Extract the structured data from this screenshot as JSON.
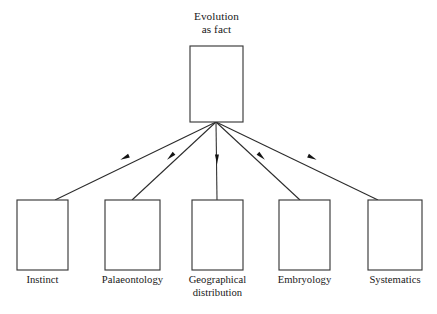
{
  "diagram": {
    "type": "hierarchy-tree",
    "orientation": "top-down",
    "background_color": "#ffffff",
    "box_stroke_color": "#3a3a3a",
    "line_color": "#2b2b2b",
    "text_color": "#171717",
    "root": {
      "id": "evolution-as-fact",
      "label_line_1": "Evolution",
      "label_line_2": "as fact",
      "label_full": "Evolution as fact",
      "label_position": "above-box",
      "box": {
        "x": 190,
        "y": 46,
        "width": 53,
        "height": 76
      }
    },
    "branch_origin": {
      "x": 216,
      "y": 122
    },
    "children": [
      {
        "id": "instinct",
        "label_line_1": "Instinct",
        "label_line_2": "",
        "label_full": "Instinct",
        "label_position": "below-box",
        "box": {
          "x": 17,
          "y": 200,
          "width": 51,
          "height": 70
        },
        "connector": {
          "from": {
            "x": 216,
            "y": 122
          },
          "to": {
            "x": 55,
            "y": 200
          },
          "arrowhead": {
            "x": 124,
            "y": 158
          }
        }
      },
      {
        "id": "palaeontology",
        "label_line_1": "Palaeontology",
        "label_line_2": "",
        "label_full": "Palaeontology",
        "label_position": "below-box",
        "box": {
          "x": 105,
          "y": 200,
          "width": 55,
          "height": 70
        },
        "connector": {
          "from": {
            "x": 216,
            "y": 122
          },
          "to": {
            "x": 132,
            "y": 200
          },
          "arrowhead": {
            "x": 170,
            "y": 157
          }
        }
      },
      {
        "id": "geographical-distribution",
        "label_line_1": "Geographical",
        "label_line_2": "distribution",
        "label_full": "Geographical distribution",
        "label_position": "below-box",
        "box": {
          "x": 192,
          "y": 200,
          "width": 51,
          "height": 70
        },
        "connector": {
          "from": {
            "x": 216,
            "y": 122
          },
          "to": {
            "x": 217,
            "y": 200
          },
          "arrowhead": {
            "x": 217,
            "y": 160
          }
        }
      },
      {
        "id": "embryology",
        "label_line_1": "Embryology",
        "label_line_2": "",
        "label_full": "Embryology",
        "label_position": "below-box",
        "box": {
          "x": 279,
          "y": 200,
          "width": 51,
          "height": 70
        },
        "connector": {
          "from": {
            "x": 216,
            "y": 122
          },
          "to": {
            "x": 300,
            "y": 200
          },
          "arrowhead": {
            "x": 262,
            "y": 157
          }
        }
      },
      {
        "id": "systematics",
        "label_line_1": "Systematics",
        "label_line_2": "",
        "label_full": "Systematics",
        "label_position": "below-box",
        "box": {
          "x": 368,
          "y": 200,
          "width": 54,
          "height": 70
        },
        "connector": {
          "from": {
            "x": 216,
            "y": 122
          },
          "to": {
            "x": 378,
            "y": 200
          },
          "arrowhead": {
            "x": 313,
            "y": 158
          }
        }
      }
    ]
  }
}
